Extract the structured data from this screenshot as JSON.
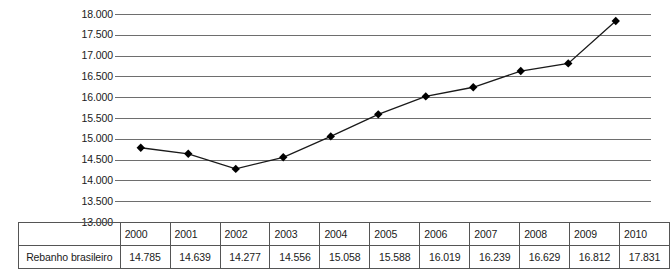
{
  "chart_data": {
    "type": "line",
    "title": "",
    "xlabel": "",
    "ylabel": "",
    "categories": [
      "2000",
      "2001",
      "2002",
      "2003",
      "2004",
      "2005",
      "2006",
      "2007",
      "2008",
      "2009",
      "2010"
    ],
    "values": [
      14785,
      14639,
      14277,
      14556,
      15058,
      15588,
      16019,
      16239,
      16629,
      16812,
      17831
    ],
    "value_labels": [
      "14.785",
      "14.639",
      "14.277",
      "14.556",
      "15.058",
      "15.588",
      "16.019",
      "16.239",
      "16.629",
      "16.812",
      "17.831"
    ],
    "series": [
      {
        "name": "Rebanho brasileiro",
        "values": [
          14785,
          14639,
          14277,
          14556,
          15058,
          15588,
          16019,
          16239,
          16629,
          16812,
          17831
        ]
      }
    ],
    "ylim": [
      13000,
      18000
    ],
    "ytick_values": [
      18000,
      17500,
      17000,
      16500,
      16000,
      15500,
      15000,
      14500,
      14000,
      13500,
      13000
    ],
    "ytick_labels": [
      "18.000",
      "17.500",
      "17.000",
      "16.500",
      "16.000",
      "15.500",
      "15.000",
      "14.500",
      "14.000",
      "13.500",
      "13.000"
    ],
    "grid": true,
    "legend": "none",
    "marker": "diamond",
    "line_color": "#1a1a1a",
    "marker_color": "#000000",
    "grid_color": "#6e6e6e"
  },
  "table": {
    "row_label": "Rebanho brasileiro",
    "years": [
      "2000",
      "2001",
      "2002",
      "2003",
      "2004",
      "2005",
      "2006",
      "2007",
      "2008",
      "2009",
      "2010"
    ],
    "values": [
      "14.785",
      "14.639",
      "14.277",
      "14.556",
      "15.058",
      "15.588",
      "16.019",
      "16.239",
      "16.629",
      "16.812",
      "17.831"
    ]
  }
}
